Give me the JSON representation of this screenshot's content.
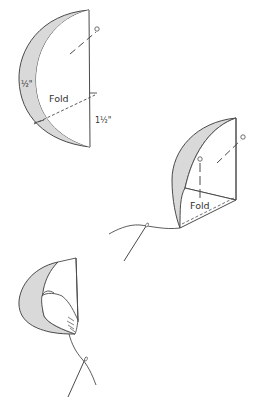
{
  "diagram": {
    "colors": {
      "stroke": "#4a4a4a",
      "seam_allowance_fill": "#d9d9d9",
      "background": "#ffffff"
    },
    "figure1": {
      "seam_label": "½\"",
      "fold_label": "Fold",
      "measure_label": "1½\""
    },
    "figure2": {
      "fold_label": "Fold"
    },
    "figure3": {}
  }
}
